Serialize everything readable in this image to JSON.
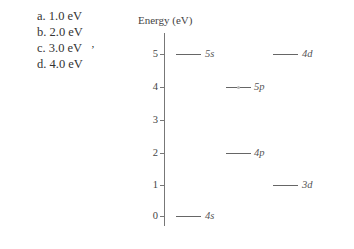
{
  "question": {
    "choices": [
      {
        "letter": "a.",
        "text": "1.0 eV"
      },
      {
        "letter": "b.",
        "text": "2.0 eV"
      },
      {
        "letter": "c.",
        "text": "3.0 eV"
      },
      {
        "letter": "d.",
        "text": "4.0 eV"
      }
    ],
    "cursor_glyph": "ʼ"
  },
  "diagram": {
    "axis_title": "Energy (eV)",
    "ticks": [
      "5",
      "4",
      "3",
      "2",
      "1",
      "0"
    ],
    "levels": [
      {
        "label": "5s",
        "energy": 5
      },
      {
        "label": "4d",
        "energy": 5
      },
      {
        "label": "5p",
        "energy": 4
      },
      {
        "label": "4p",
        "energy": 2
      },
      {
        "label": "3d",
        "energy": 1
      },
      {
        "label": "4s",
        "energy": 0
      }
    ]
  }
}
